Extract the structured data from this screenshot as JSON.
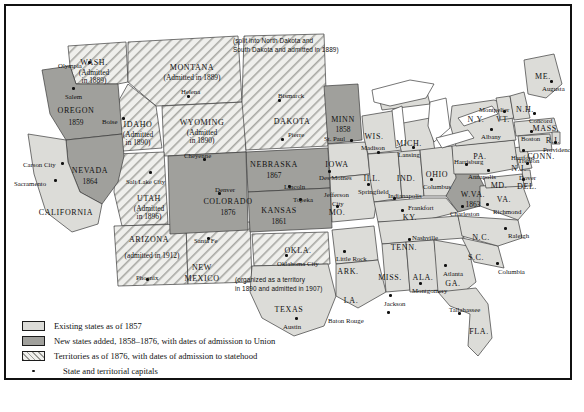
{
  "map": {
    "title": "United States territorial expansion, 1857-1876",
    "colors": {
      "existing_states": "#dcdcd8",
      "new_states": "#a0a09c",
      "territories_hatch": "#9a9a95",
      "water": "#ffffff",
      "border": "#111111"
    }
  },
  "legend": {
    "items": [
      {
        "swatch": "existing",
        "label": "Existing states as of 1857"
      },
      {
        "swatch": "new",
        "label": "New states added, 1858–1876, with dates of admission to Union"
      },
      {
        "swatch": "territory",
        "label": "Territories as of 1876, with dates of admission to statehood"
      },
      {
        "swatch": "dot",
        "label": "State and territorial capitals"
      }
    ]
  },
  "annotations": [
    {
      "id": "dakota-note",
      "text": "(split into North Dakota and\nSouth Dakota and admitted in 1889)"
    },
    {
      "id": "oklahoma-note",
      "text": "(organized as a territory\nin 1890 and admitted in 1907)"
    }
  ],
  "regions": {
    "new_states": [
      {
        "name": "OREGON",
        "year": "1859"
      },
      {
        "name": "NEVADA",
        "year": "1864"
      },
      {
        "name": "NEBRASKA",
        "year": "1867"
      },
      {
        "name": "KANSAS",
        "year": "1861"
      },
      {
        "name": "COLORADO",
        "year": "1876"
      },
      {
        "name": "MINN",
        "year": "1858"
      },
      {
        "name": "W.VA.",
        "year": "1863"
      }
    ],
    "territories": [
      {
        "name": "WASH.",
        "note": "(Admitted\nin 1889)"
      },
      {
        "name": "MONTANA",
        "note": "(Admitted in 1889)"
      },
      {
        "name": "IDAHO",
        "note": "(Admitted\nin 1890)"
      },
      {
        "name": "WYOMING",
        "note": "(Admitted\nin 1890)"
      },
      {
        "name": "UTAH",
        "note": "(Admitted\nin 1896)"
      },
      {
        "name": "ARIZONA",
        "note": "(admitted in 1912)"
      },
      {
        "name": "NEW\nMEXICO",
        "note": ""
      },
      {
        "name": "DAKOTA",
        "note": ""
      },
      {
        "name": "OKLA.",
        "note": ""
      }
    ],
    "existing_states": [
      "CALIFORNIA",
      "TEXAS",
      "IOWA",
      "MO.",
      "ARK.",
      "LA.",
      "MISS.",
      "ALA.",
      "GA.",
      "FLA.",
      "TENN.",
      "KY.",
      "S.C.",
      "N.C.",
      "VA.",
      "MD.",
      "DEL.",
      "N.J.",
      "PA.",
      "OHIO",
      "IND.",
      "ILL.",
      "MICH.",
      "WIS.",
      "N.Y.",
      "CONN.",
      "R.I.",
      "MASS.",
      "VT.",
      "N.H.",
      "ME."
    ]
  },
  "labels": [
    {
      "text": "WASH.",
      "x": 88,
      "y": 53,
      "cls": "st ctr"
    },
    {
      "text": "(Admitted",
      "x": 88,
      "y": 63,
      "cls": "yr ctr"
    },
    {
      "text": "in 1889)",
      "x": 88,
      "y": 71,
      "cls": "yr ctr"
    },
    {
      "text": "Olympia",
      "x": 52,
      "y": 56,
      "cls": "cap"
    },
    {
      "text": "OREGON",
      "x": 70,
      "y": 101,
      "cls": "st ctr"
    },
    {
      "text": "1859",
      "x": 70,
      "y": 113,
      "cls": "yr ctr"
    },
    {
      "text": "Salem",
      "x": 59,
      "y": 87,
      "cls": "cap"
    },
    {
      "text": "MONTANA",
      "x": 186,
      "y": 58,
      "cls": "st ctr"
    },
    {
      "text": "(Admitted in 1889)",
      "x": 186,
      "y": 68,
      "cls": "yr ctr"
    },
    {
      "text": "Helena",
      "x": 175,
      "y": 82,
      "cls": "cap"
    },
    {
      "text": "IDAHO",
      "x": 132,
      "y": 115,
      "cls": "st ctr"
    },
    {
      "text": "(Admitted",
      "x": 132,
      "y": 125,
      "cls": "yr ctr"
    },
    {
      "text": "in 1890)",
      "x": 132,
      "y": 133,
      "cls": "yr ctr"
    },
    {
      "text": "Boise",
      "x": 96,
      "y": 112,
      "cls": "cap"
    },
    {
      "text": "WYOMING",
      "x": 196,
      "y": 113,
      "cls": "st ctr"
    },
    {
      "text": "(Admitted",
      "x": 196,
      "y": 123,
      "cls": "yr ctr"
    },
    {
      "text": "in 1890)",
      "x": 196,
      "y": 131,
      "cls": "yr ctr"
    },
    {
      "text": "Cheyenne",
      "x": 178,
      "y": 146,
      "cls": "cap"
    },
    {
      "text": "NEVADA",
      "x": 84,
      "y": 161,
      "cls": "st ctr"
    },
    {
      "text": "1864",
      "x": 84,
      "y": 172,
      "cls": "yr ctr"
    },
    {
      "text": "Carson City",
      "x": 17,
      "y": 155,
      "cls": "cap"
    },
    {
      "text": "Sacramento",
      "x": 8,
      "y": 174,
      "cls": "cap"
    },
    {
      "text": "CALIFORNIA",
      "x": 60,
      "y": 203,
      "cls": "st ctr"
    },
    {
      "text": "UTAH",
      "x": 143,
      "y": 189,
      "cls": "st ctr"
    },
    {
      "text": "(Admitted",
      "x": 143,
      "y": 199,
      "cls": "yr ctr"
    },
    {
      "text": "in 1896)",
      "x": 143,
      "y": 207,
      "cls": "yr ctr"
    },
    {
      "text": "Salt Lake City",
      "x": 120,
      "y": 172,
      "cls": "cap"
    },
    {
      "text": "COLORADO",
      "x": 222,
      "y": 192,
      "cls": "st ctr"
    },
    {
      "text": "1876",
      "x": 222,
      "y": 203,
      "cls": "yr ctr"
    },
    {
      "text": "Denver",
      "x": 209,
      "y": 180,
      "cls": "cap"
    },
    {
      "text": "ARIZONA",
      "x": 143,
      "y": 230,
      "cls": "st ctr"
    },
    {
      "text": "(admitted in 1912)",
      "x": 146,
      "y": 246,
      "cls": "yr ctr"
    },
    {
      "text": "Phoenix",
      "x": 130,
      "y": 268,
      "cls": "cap"
    },
    {
      "text": "NEW",
      "x": 196,
      "y": 258,
      "cls": "st ctr"
    },
    {
      "text": "MEXICO",
      "x": 196,
      "y": 269,
      "cls": "st ctr"
    },
    {
      "text": "Santa Fe",
      "x": 188,
      "y": 231,
      "cls": "cap"
    },
    {
      "text": "DAKOTA",
      "x": 286,
      "y": 112,
      "cls": "st ctr"
    },
    {
      "text": "Bismarck",
      "x": 272,
      "y": 86,
      "cls": "cap"
    },
    {
      "text": "Pierre",
      "x": 282,
      "y": 125,
      "cls": "cap"
    },
    {
      "text": "NEBRASKA",
      "x": 268,
      "y": 155,
      "cls": "st ctr"
    },
    {
      "text": "1867",
      "x": 268,
      "y": 166,
      "cls": "yr ctr"
    },
    {
      "text": "Lincoln",
      "x": 278,
      "y": 177,
      "cls": "cap"
    },
    {
      "text": "KANSAS",
      "x": 273,
      "y": 201,
      "cls": "st ctr"
    },
    {
      "text": "1861",
      "x": 273,
      "y": 212,
      "cls": "yr ctr"
    },
    {
      "text": "Topeka",
      "x": 287,
      "y": 190,
      "cls": "cap"
    },
    {
      "text": "MINN",
      "x": 337,
      "y": 110,
      "cls": "st ctr"
    },
    {
      "text": "1858",
      "x": 337,
      "y": 120,
      "cls": "yr ctr"
    },
    {
      "text": "St. Paul",
      "x": 318,
      "y": 129,
      "cls": "cap"
    },
    {
      "text": "IOWA",
      "x": 331,
      "y": 155,
      "cls": "st ctr"
    },
    {
      "text": "Des Moines",
      "x": 313,
      "y": 168,
      "cls": "cap"
    },
    {
      "text": "WIS.",
      "x": 368,
      "y": 127,
      "cls": "st ctr"
    },
    {
      "text": "Madison",
      "x": 355,
      "y": 138,
      "cls": "cap"
    },
    {
      "text": "MICH.",
      "x": 403,
      "y": 134,
      "cls": "st ctr"
    },
    {
      "text": "Lansing",
      "x": 392,
      "y": 145,
      "cls": "cap"
    },
    {
      "text": "ILL.",
      "x": 366,
      "y": 169,
      "cls": "st ctr"
    },
    {
      "text": "Springfield",
      "x": 352,
      "y": 182,
      "cls": "cap"
    },
    {
      "text": "IND.",
      "x": 400,
      "y": 169,
      "cls": "st ctr"
    },
    {
      "text": "Indianapolis",
      "x": 382,
      "y": 186,
      "cls": "cap"
    },
    {
      "text": "OHIO",
      "x": 431,
      "y": 165,
      "cls": "st ctr"
    },
    {
      "text": "Columbus",
      "x": 417,
      "y": 177,
      "cls": "cap"
    },
    {
      "text": "MO.",
      "x": 331,
      "y": 203,
      "cls": "st ctr"
    },
    {
      "text": "Jefferson",
      "x": 318,
      "y": 185,
      "cls": "cap"
    },
    {
      "text": "City",
      "x": 326,
      "y": 194,
      "cls": "cap"
    },
    {
      "text": "KY.",
      "x": 404,
      "y": 208,
      "cls": "st ctr"
    },
    {
      "text": "Frankfort",
      "x": 402,
      "y": 198,
      "cls": "cap"
    },
    {
      "text": "TENN.",
      "x": 398,
      "y": 238,
      "cls": "st ctr"
    },
    {
      "text": "Nashville",
      "x": 406,
      "y": 228,
      "cls": "cap"
    },
    {
      "text": "W.VA.",
      "x": 467,
      "y": 185,
      "cls": "st ctr"
    },
    {
      "text": "1863",
      "x": 467,
      "y": 195,
      "cls": "yr ctr"
    },
    {
      "text": "Charleston",
      "x": 444,
      "y": 204,
      "cls": "cap"
    },
    {
      "text": "VA.",
      "x": 498,
      "y": 190,
      "cls": "st ctr"
    },
    {
      "text": "Richmond",
      "x": 487,
      "y": 202,
      "cls": "cap"
    },
    {
      "text": "PA.",
      "x": 474,
      "y": 147,
      "cls": "st ctr"
    },
    {
      "text": "Harrisburg",
      "x": 448,
      "y": 152,
      "cls": "cap"
    },
    {
      "text": "MD.",
      "x": 493,
      "y": 176,
      "cls": "st ctr"
    },
    {
      "text": "Annapolis",
      "x": 462,
      "y": 167,
      "cls": "cap"
    },
    {
      "text": "DEL.",
      "x": 521,
      "y": 177,
      "cls": "st ctr"
    },
    {
      "text": "Dover",
      "x": 513,
      "y": 168,
      "cls": "cap"
    },
    {
      "text": "N.J.",
      "x": 513,
      "y": 159,
      "cls": "st ctr"
    },
    {
      "text": "Trenton",
      "x": 512,
      "y": 151,
      "cls": "cap"
    },
    {
      "text": "N.Y.",
      "x": 470,
      "y": 110,
      "cls": "st ctr"
    },
    {
      "text": "Albany",
      "x": 475,
      "y": 127,
      "cls": "cap"
    },
    {
      "text": "VT.",
      "x": 497,
      "y": 110,
      "cls": "st ctr"
    },
    {
      "text": "Montpelier",
      "x": 473,
      "y": 100,
      "cls": "cap"
    },
    {
      "text": "N.H.",
      "x": 519,
      "y": 100,
      "cls": "st ctr"
    },
    {
      "text": "Concord",
      "x": 523,
      "y": 111,
      "cls": "cap"
    },
    {
      "text": "ME.",
      "x": 537,
      "y": 67,
      "cls": "st ctr"
    },
    {
      "text": "Augusta",
      "x": 536,
      "y": 79,
      "cls": "cap"
    },
    {
      "text": "MASS.",
      "x": 540,
      "y": 119,
      "cls": "st ctr"
    },
    {
      "text": "Boston",
      "x": 515,
      "y": 129,
      "cls": "cap"
    },
    {
      "text": "R.I.",
      "x": 547,
      "y": 131,
      "cls": "st ctr"
    },
    {
      "text": "Providence",
      "x": 537,
      "y": 140,
      "cls": "cap"
    },
    {
      "text": "CONN.",
      "x": 535,
      "y": 147,
      "cls": "st ctr"
    },
    {
      "text": "Hartford",
      "x": 505,
      "y": 148,
      "cls": "cap"
    },
    {
      "text": "N.C.",
      "x": 475,
      "y": 228,
      "cls": "st ctr"
    },
    {
      "text": "Raleigh",
      "x": 502,
      "y": 226,
      "cls": "cap"
    },
    {
      "text": "S.C.",
      "x": 470,
      "y": 248,
      "cls": "st ctr"
    },
    {
      "text": "Columbia",
      "x": 492,
      "y": 262,
      "cls": "cap"
    },
    {
      "text": "GA.",
      "x": 447,
      "y": 274,
      "cls": "st ctr"
    },
    {
      "text": "Atlanta",
      "x": 437,
      "y": 264,
      "cls": "cap"
    },
    {
      "text": "ALA.",
      "x": 417,
      "y": 268,
      "cls": "st ctr"
    },
    {
      "text": "Montgomery",
      "x": 406,
      "y": 281,
      "cls": "cap"
    },
    {
      "text": "MISS.",
      "x": 384,
      "y": 268,
      "cls": "st ctr"
    },
    {
      "text": "Jackson",
      "x": 378,
      "y": 294,
      "cls": "cap"
    },
    {
      "text": "FLA.",
      "x": 473,
      "y": 322,
      "cls": "st ctr"
    },
    {
      "text": "Tallahassee",
      "x": 443,
      "y": 300,
      "cls": "cap"
    },
    {
      "text": "LA.",
      "x": 345,
      "y": 291,
      "cls": "st ctr"
    },
    {
      "text": "Baton Rouge",
      "x": 322,
      "y": 311,
      "cls": "cap"
    },
    {
      "text": "ARK.",
      "x": 342,
      "y": 262,
      "cls": "st ctr"
    },
    {
      "text": "Little Rock",
      "x": 330,
      "y": 249,
      "cls": "cap"
    },
    {
      "text": "OKLA.",
      "x": 292,
      "y": 241,
      "cls": "st ctr"
    },
    {
      "text": "Oklahoma City",
      "x": 271,
      "y": 254,
      "cls": "cap"
    },
    {
      "text": "TEXAS",
      "x": 283,
      "y": 300,
      "cls": "st ctr"
    },
    {
      "text": "Austin",
      "x": 277,
      "y": 317,
      "cls": "cap"
    }
  ],
  "capital_dots": [
    {
      "x": 82,
      "y": 55
    },
    {
      "x": 66,
      "y": 81
    },
    {
      "x": 116,
      "y": 111
    },
    {
      "x": 181,
      "y": 89
    },
    {
      "x": 197,
      "y": 152
    },
    {
      "x": 55,
      "y": 156
    },
    {
      "x": 48,
      "y": 173
    },
    {
      "x": 143,
      "y": 165
    },
    {
      "x": 212,
      "y": 186
    },
    {
      "x": 201,
      "y": 231
    },
    {
      "x": 140,
      "y": 272
    },
    {
      "x": 272,
      "y": 93
    },
    {
      "x": 275,
      "y": 132
    },
    {
      "x": 282,
      "y": 179
    },
    {
      "x": 293,
      "y": 192
    },
    {
      "x": 344,
      "y": 133
    },
    {
      "x": 322,
      "y": 164
    },
    {
      "x": 371,
      "y": 145
    },
    {
      "x": 406,
      "y": 140
    },
    {
      "x": 361,
      "y": 177
    },
    {
      "x": 387,
      "y": 191
    },
    {
      "x": 424,
      "y": 172
    },
    {
      "x": 330,
      "y": 199
    },
    {
      "x": 395,
      "y": 203
    },
    {
      "x": 402,
      "y": 232
    },
    {
      "x": 455,
      "y": 199
    },
    {
      "x": 480,
      "y": 197
    },
    {
      "x": 459,
      "y": 157
    },
    {
      "x": 481,
      "y": 163
    },
    {
      "x": 516,
      "y": 172
    },
    {
      "x": 520,
      "y": 156
    },
    {
      "x": 484,
      "y": 122
    },
    {
      "x": 497,
      "y": 104
    },
    {
      "x": 527,
      "y": 106
    },
    {
      "x": 544,
      "y": 74
    },
    {
      "x": 524,
      "y": 124
    },
    {
      "x": 548,
      "y": 135
    },
    {
      "x": 516,
      "y": 143
    },
    {
      "x": 498,
      "y": 221
    },
    {
      "x": 490,
      "y": 256
    },
    {
      "x": 438,
      "y": 258
    },
    {
      "x": 413,
      "y": 276
    },
    {
      "x": 383,
      "y": 288
    },
    {
      "x": 452,
      "y": 306
    },
    {
      "x": 337,
      "y": 244
    },
    {
      "x": 381,
      "y": 305
    },
    {
      "x": 279,
      "y": 248
    },
    {
      "x": 289,
      "y": 311
    }
  ]
}
